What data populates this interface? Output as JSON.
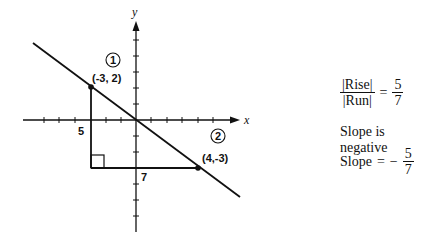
{
  "diagram": {
    "axes": {
      "x_label": "x",
      "y_label": "y"
    },
    "points": [
      {
        "marker": "1",
        "label": "(-3, 2)",
        "x": -3,
        "y": 2
      },
      {
        "marker": "2",
        "label": "(4,-3)",
        "x": 4,
        "y": -3
      }
    ],
    "triangle": {
      "rise_label": "5",
      "run_label": "7"
    }
  },
  "equations": {
    "ratio": {
      "numerator": "|Rise|",
      "denominator": "|Run|",
      "equals": "=",
      "value_num": "5",
      "value_den": "7"
    },
    "sign_statement": "Slope is negative",
    "slope": {
      "label": "Slope",
      "equals": "=",
      "sign": "−",
      "value_num": "5",
      "value_den": "7"
    }
  }
}
